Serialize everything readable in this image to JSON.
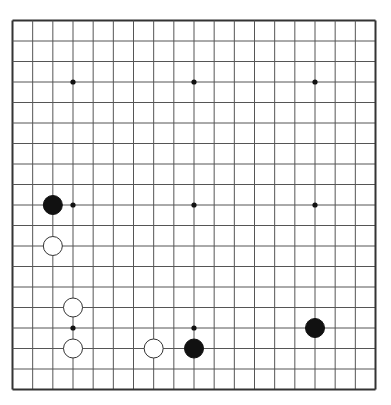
{
  "board": {
    "size": 19,
    "background": "#ffffff",
    "line_color": "#555555",
    "border_color": "#333333",
    "star_points": [
      [
        3,
        3
      ],
      [
        9,
        3
      ],
      [
        15,
        3
      ],
      [
        3,
        9
      ],
      [
        9,
        9
      ],
      [
        15,
        9
      ],
      [
        3,
        15
      ],
      [
        9,
        15
      ],
      [
        15,
        15
      ]
    ],
    "stones": [
      {
        "color": "black",
        "col": 2,
        "row": 9
      },
      {
        "color": "white",
        "col": 2,
        "row": 11
      },
      {
        "color": "white",
        "col": 3,
        "row": 14
      },
      {
        "color": "white",
        "col": 3,
        "row": 16
      },
      {
        "color": "white",
        "col": 7,
        "row": 16
      },
      {
        "color": "black",
        "col": 9,
        "row": 16
      },
      {
        "color": "black",
        "col": 15,
        "row": 15
      }
    ],
    "colors": {
      "black": "#111111",
      "white": "#ffffff"
    }
  }
}
